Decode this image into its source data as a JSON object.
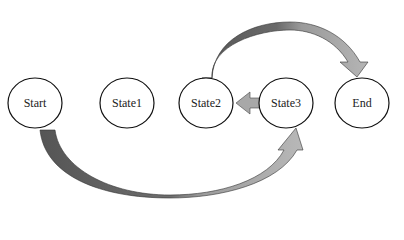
{
  "diagram": {
    "type": "state-diagram",
    "nodes": [
      {
        "id": "start",
        "label": "Start",
        "cx": 35,
        "cy": 103
      },
      {
        "id": "state1",
        "label": "State1",
        "cx": 127,
        "cy": 103
      },
      {
        "id": "state2",
        "label": "State2",
        "cx": 206,
        "cy": 103
      },
      {
        "id": "state3",
        "label": "State3",
        "cx": 286,
        "cy": 103
      },
      {
        "id": "end",
        "label": "End",
        "cx": 362,
        "cy": 103
      }
    ],
    "edges": [
      {
        "from": "state2",
        "to": "end",
        "style": "curved-arrow-over"
      },
      {
        "from": "state3",
        "to": "state2",
        "style": "straight-block-arrow"
      },
      {
        "from": "start",
        "to": "state3",
        "style": "curved-arrow-under"
      }
    ],
    "colors": {
      "arrow_dark": "#5a5a5a",
      "arrow_light": "#b0b0b0",
      "node_stroke": "#111111",
      "node_fill": "#ffffff"
    }
  }
}
